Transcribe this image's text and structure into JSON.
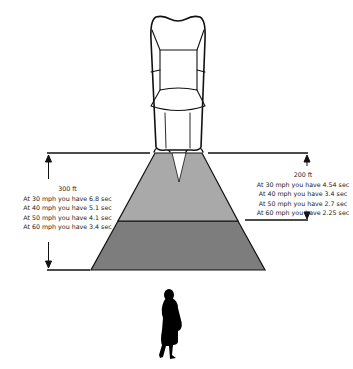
{
  "diagram": {
    "colors": {
      "near_zone": "#a9a9a9",
      "far_zone": "#7d7d7d",
      "outline": "#111111",
      "background": "#ffffff"
    },
    "left_dimension": {
      "distance": "300 ft",
      "lines": [
        "At 30 mph you have 6.8 sec",
        "At 40 mph you have 5.1 sec",
        "At 50 mph you have 4.1 sec",
        "At 60 mph you have 3.4 sec"
      ]
    },
    "right_dimension": {
      "distance": "200 ft",
      "lines": [
        "At 30 mph you have 4.54 sec",
        "At 40 mph you have 3.4 sec",
        "At 50 mph you have 2.7 sec",
        "At 60 mph you have 2.25 sec"
      ]
    },
    "icons": {
      "vehicle": "car-top-view-icon",
      "pedestrian": "pedestrian-silhouette-icon"
    }
  }
}
